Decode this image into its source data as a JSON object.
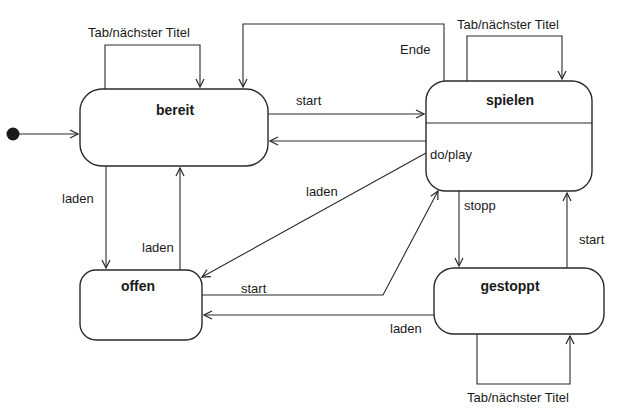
{
  "diagram": {
    "type": "state-machine",
    "initial_state": "bereit",
    "states": [
      {
        "id": "bereit",
        "label": "bereit"
      },
      {
        "id": "spielen",
        "label": "spielen",
        "activity": "do/play"
      },
      {
        "id": "offen",
        "label": "offen"
      },
      {
        "id": "gestoppt",
        "label": "gestoppt"
      }
    ],
    "transitions": [
      {
        "from": "bereit",
        "to": "bereit",
        "label": "Tab/nächster Titel"
      },
      {
        "from": "spielen",
        "to": "spielen",
        "label": "Tab/nächster Titel"
      },
      {
        "from": "gestoppt",
        "to": "gestoppt",
        "label": "Tab/nächster Titel"
      },
      {
        "from": "bereit",
        "to": "spielen",
        "label": "start"
      },
      {
        "from": "spielen",
        "to": "bereit",
        "label": "Ende"
      },
      {
        "from": "spielen",
        "to": "bereit",
        "label": ""
      },
      {
        "from": "bereit",
        "to": "offen",
        "label": "laden"
      },
      {
        "from": "offen",
        "to": "bereit",
        "label": "laden"
      },
      {
        "from": "spielen",
        "to": "offen",
        "label": "laden"
      },
      {
        "from": "offen",
        "to": "spielen",
        "label": "start"
      },
      {
        "from": "spielen",
        "to": "gestoppt",
        "label": "stopp"
      },
      {
        "from": "gestoppt",
        "to": "spielen",
        "label": "start"
      },
      {
        "from": "gestoppt",
        "to": "offen",
        "label": "laden"
      }
    ],
    "labels": {
      "self_bereit": "Tab/nächster Titel",
      "self_spielen": "Tab/nächster Titel",
      "self_gestoppt": "Tab/nächster Titel",
      "ende": "Ende",
      "start_bereit_spielen": "start",
      "do_play": "do/play",
      "laden_bereit_offen": "laden",
      "laden_offen_bereit": "laden",
      "laden_spielen_offen": "laden",
      "start_offen_spielen": "start",
      "stopp": "stopp",
      "start_gestoppt_spielen": "start",
      "laden_gestoppt_offen": "laden"
    }
  }
}
